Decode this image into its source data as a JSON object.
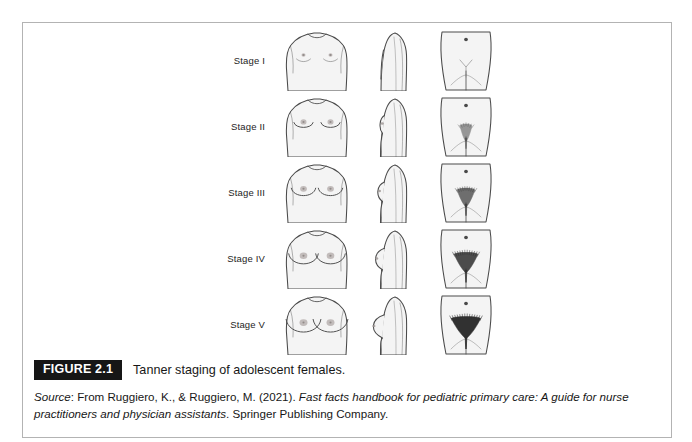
{
  "figure": {
    "badge": "FIGURE 2.1",
    "caption": "Tanner staging of adolescent females.",
    "source": {
      "label": "Source",
      "separator": ": ",
      "attribution": "From Ruggiero, K., & Ruggiero, M. (2021). ",
      "work_title": "Fast facts handbook for pediatric primary care: A guide for nurse practitioners and physician assistants",
      "publisher": ". Springer Publishing Company."
    }
  },
  "illustration": {
    "columns": [
      {
        "name": "frontal-view",
        "label": "Frontal breast view"
      },
      {
        "name": "lateral-view",
        "label": "Lateral breast profile"
      },
      {
        "name": "pubic-view",
        "label": "Pubic hair distribution"
      }
    ],
    "stages": [
      {
        "label": "Stage I",
        "breast_size": 0,
        "areola_size": 2.0,
        "profile_projection": 0,
        "pubic_hair_spread": 0,
        "pubic_hair_density": 0
      },
      {
        "label": "Stage II",
        "breast_size": 1,
        "areola_size": 3.0,
        "profile_projection": 3,
        "pubic_hair_spread": 5,
        "pubic_hair_density": 0.25
      },
      {
        "label": "Stage III",
        "breast_size": 2,
        "areola_size": 3.4,
        "profile_projection": 6,
        "pubic_hair_spread": 9,
        "pubic_hair_density": 0.55
      },
      {
        "label": "Stage IV",
        "breast_size": 3,
        "areola_size": 3.8,
        "profile_projection": 9,
        "pubic_hair_spread": 13,
        "pubic_hair_density": 0.8
      },
      {
        "label": "Stage V",
        "breast_size": 4,
        "areola_size": 4.0,
        "profile_projection": 12,
        "pubic_hair_spread": 17,
        "pubic_hair_density": 1.0
      }
    ]
  },
  "colors": {
    "frame_border": "#b3b3b3",
    "badge_background": "#161616",
    "badge_text": "#ffffff",
    "body_text": "#171717",
    "illustration_outline": "#4a4a4a",
    "illustration_fill": "#f4f4f4",
    "hair_dark": "#2e2e2e",
    "page_background": "#ffffff"
  }
}
